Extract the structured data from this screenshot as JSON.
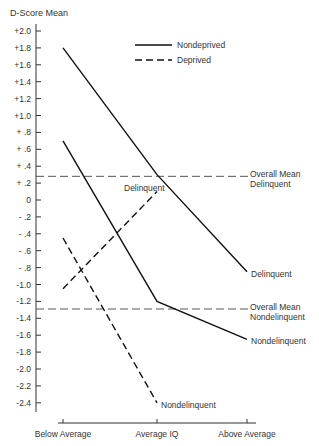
{
  "chart_data": {
    "type": "line",
    "title": "",
    "ylabel": "D-Score Mean",
    "xlabel": "",
    "categories": [
      "Below Average",
      "Average IQ",
      "Above Average"
    ],
    "ylim": [
      -2.4,
      2.0
    ],
    "yticks": [
      "+2.0",
      "+1.8",
      "+1.6",
      "+1.4",
      "+1.2",
      "+1.0",
      "+ .8",
      "+ .6",
      "+ .4",
      "+ .2",
      "0",
      "- .2",
      "- .4",
      "- .6",
      "- .8",
      "-1.0",
      "-1.2",
      "-1.4",
      "-1.6",
      "-1.8",
      "-2.0",
      "-2.2",
      "-2.4"
    ],
    "ytick_values": [
      2.0,
      1.8,
      1.6,
      1.4,
      1.2,
      1.0,
      0.8,
      0.6,
      0.4,
      0.2,
      0,
      -0.2,
      -0.4,
      -0.6,
      -0.8,
      -1.0,
      -1.2,
      -1.4,
      -1.6,
      -1.8,
      -2.0,
      -2.2,
      -2.4
    ],
    "grid": false,
    "legend": {
      "position": "top-right",
      "entries": [
        {
          "label": "Nondeprived",
          "style": "solid"
        },
        {
          "label": "Deprived",
          "style": "dashed"
        }
      ]
    },
    "series": [
      {
        "name": "Nondeprived Delinquent",
        "style": "solid",
        "label": "Delinquent",
        "values": [
          1.8,
          0.3,
          -0.85
        ]
      },
      {
        "name": "Nondeprived Nondelinquent",
        "style": "solid",
        "label": "Nondelinquent",
        "values": [
          0.7,
          -1.2,
          -1.65
        ]
      },
      {
        "name": "Deprived Delinquent",
        "style": "dashed",
        "label": "Delinquent",
        "values": [
          -1.05,
          0.1,
          null
        ]
      },
      {
        "name": "Deprived Nondelinquent",
        "style": "dashed",
        "label": "Nondelinquent",
        "values": [
          -0.45,
          -2.4,
          null
        ]
      }
    ],
    "reference_lines": [
      {
        "label_line1": "Overall Mean",
        "label_line2": "Delinquent",
        "value": 0.28
      },
      {
        "label_line1": "Overall Mean",
        "label_line2": "Nondelinquent",
        "value": -1.29
      }
    ]
  }
}
